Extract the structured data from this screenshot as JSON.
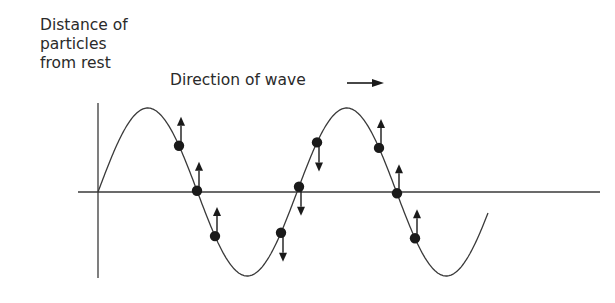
{
  "diagram": {
    "y_axis_label_lines": [
      "Distance of",
      "particles",
      "from rest"
    ],
    "direction_label": "Direction of wave",
    "direction_arrow": "right",
    "colors": {
      "line": "#3a3a3a",
      "particle": "#1a1a1a",
      "background": "#ffffff"
    },
    "wave": {
      "origin_x": 98,
      "axis_y": 192,
      "half_wavelength_px": 99.5,
      "amplitude_px": 84,
      "end_x": 488,
      "description": "Sine wave starting at origin, going up first, ending on axis after second trough"
    },
    "particles": [
      {
        "id": 1,
        "position": "between first crest and first zero",
        "motion": "up"
      },
      {
        "id": 2,
        "position": "on axis (first zero crossing)",
        "motion": "up"
      },
      {
        "id": 3,
        "position": "between first zero and first trough",
        "motion": "up"
      },
      {
        "id": 4,
        "position": "between first trough and second zero",
        "motion": "down"
      },
      {
        "id": 5,
        "position": "on axis (second zero crossing)",
        "motion": "down"
      },
      {
        "id": 6,
        "position": "between second zero and second crest",
        "motion": "down"
      },
      {
        "id": 7,
        "position": "between second crest and third zero",
        "motion": "up"
      },
      {
        "id": 8,
        "position": "on axis (third zero crossing)",
        "motion": "up"
      },
      {
        "id": 9,
        "position": "between third zero and second trough",
        "motion": "up"
      }
    ]
  }
}
